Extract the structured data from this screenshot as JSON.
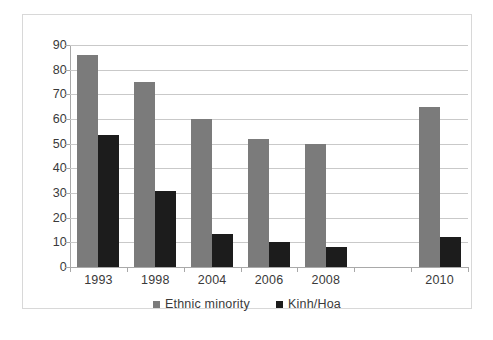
{
  "chart_data": {
    "type": "bar",
    "title": "",
    "subtitle": "",
    "xlabel": "",
    "ylabel": "",
    "categories": [
      "1993",
      "1998",
      "2004",
      "2006",
      "2008",
      "",
      "2010"
    ],
    "series": [
      {
        "name": "Ethnic minority",
        "color": "#7b7b7b",
        "values": [
          86,
          75,
          60,
          52,
          50,
          null,
          65
        ]
      },
      {
        "name": "Kinh/Hoa",
        "color": "#1c1c1c",
        "values": [
          53.5,
          31,
          13.5,
          10,
          8,
          null,
          12
        ]
      }
    ],
    "ylim": [
      0,
      90
    ],
    "ytick_step": 10,
    "ytick_labels": [
      "90",
      "80",
      "70",
      "60",
      "50",
      "40",
      "30",
      "20",
      "10",
      "0"
    ],
    "grid": true,
    "grid_axis": "y",
    "legend_position": "bottom-center"
  },
  "frame": {
    "border_color": "#d8d8d8",
    "background": "#ffffff"
  }
}
